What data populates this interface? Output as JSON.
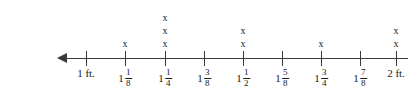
{
  "chart_data": {
    "type": "bar",
    "subtype": "line-plot-dot-plot",
    "title": "",
    "xlabel": "",
    "ylabel": "",
    "mark_glyph": "x",
    "axis": {
      "arrow_left": true,
      "arrow_right": false,
      "start_label": "1 ft.",
      "end_label": "2 ft.",
      "tick_count": 9,
      "step": "1/8"
    },
    "categories": [
      "1 ft.",
      "1 1/8",
      "1 1/4",
      "1 3/8",
      "1 1/2",
      "1 5/8",
      "1 3/4",
      "1 7/8",
      "2 ft."
    ],
    "values": [
      0,
      1,
      3,
      0,
      2,
      0,
      1,
      0,
      2
    ],
    "ylim": [
      0,
      3
    ],
    "grid": false,
    "legend": null
  },
  "ticks": [
    {
      "id": "tick-1ft",
      "type": "plain",
      "text": "1 ft.",
      "x": 86,
      "count": 0
    },
    {
      "id": "tick-1-1-8",
      "type": "mixed",
      "whole": "1",
      "num": "1",
      "den": "8",
      "x": 125,
      "count": 1
    },
    {
      "id": "tick-1-1-4",
      "type": "mixed",
      "whole": "1",
      "num": "1",
      "den": "4",
      "x": 165,
      "count": 3
    },
    {
      "id": "tick-1-3-8",
      "type": "mixed",
      "whole": "1",
      "num": "3",
      "den": "8",
      "x": 204,
      "count": 0
    },
    {
      "id": "tick-1-1-2",
      "type": "mixed",
      "whole": "1",
      "num": "1",
      "den": "2",
      "x": 243,
      "count": 2
    },
    {
      "id": "tick-1-5-8",
      "type": "mixed",
      "whole": "1",
      "num": "5",
      "den": "8",
      "x": 282,
      "count": 0
    },
    {
      "id": "tick-1-3-4",
      "type": "mixed",
      "whole": "1",
      "num": "3",
      "den": "4",
      "x": 321,
      "count": 1
    },
    {
      "id": "tick-1-7-8",
      "type": "mixed",
      "whole": "1",
      "num": "7",
      "den": "8",
      "x": 360,
      "count": 0
    },
    {
      "id": "tick-2ft",
      "type": "plain",
      "text": "2 ft.",
      "x": 396,
      "count": 2
    }
  ],
  "colors": {
    "line": "#3a3a3a",
    "text": "#1a1a1a",
    "background": "#ffffff"
  }
}
